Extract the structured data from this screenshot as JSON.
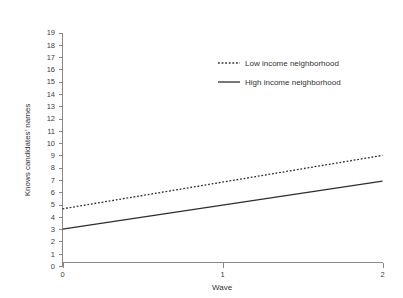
{
  "chart_data": {
    "type": "line",
    "title": "",
    "xlabel": "Wave",
    "ylabel": "Knows candidates' names",
    "xlim": [
      0,
      2
    ],
    "ylim": [
      0,
      19
    ],
    "x": [
      0,
      1,
      2
    ],
    "xticks": [
      "0",
      "1",
      "2"
    ],
    "yticks": [
      "0",
      "1",
      "2",
      "3",
      "4",
      "5",
      "6",
      "7",
      "8",
      "9",
      "10",
      "11",
      "12",
      "13",
      "14",
      "15",
      "16",
      "17",
      "18",
      "19"
    ],
    "grid": false,
    "legend_position": "upper-right",
    "series": [
      {
        "name": "Low income neighborhood",
        "style": "dotted",
        "color": "#2e2e2e",
        "x": [
          0,
          2
        ],
        "values": [
          4.65,
          9.0
        ]
      },
      {
        "name": "High income neighborhood",
        "style": "solid",
        "color": "#2e2e2e",
        "x": [
          0,
          2
        ],
        "values": [
          3.0,
          6.9
        ]
      }
    ]
  },
  "axes": {
    "y_axis_title": "Knows candidates' names",
    "x_axis_title": "Wave",
    "y_tick_labels": [
      "19",
      "18",
      "17",
      "16",
      "15",
      "14",
      "13",
      "12",
      "11",
      "10",
      "9",
      "8",
      "7",
      "6",
      "5",
      "4",
      "3",
      "2",
      "1",
      "0"
    ],
    "x_tick_labels": [
      "0",
      "1",
      "2"
    ]
  },
  "legend": {
    "entries": [
      {
        "label": "Low income neighborhood",
        "style": "dotted"
      },
      {
        "label": "High income neighborhood",
        "style": "solid"
      }
    ]
  }
}
